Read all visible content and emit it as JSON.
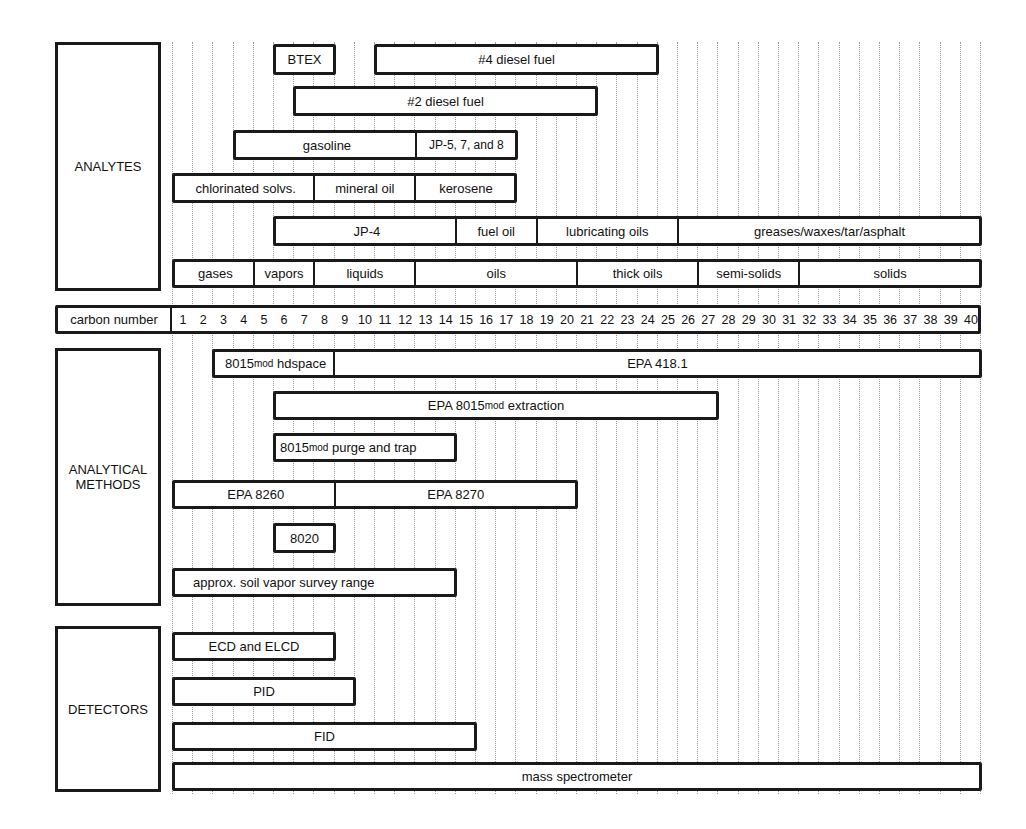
{
  "grid": {
    "x0": 172,
    "col_width": 20.2,
    "columns": 40
  },
  "categories": {
    "analytes": "ANALYTES",
    "methods_line1": "ANALYTICAL",
    "methods_line2": "METHODS",
    "detectors": "DETECTORS"
  },
  "carbon_row": {
    "label": "carbon number",
    "numbers": [
      "1",
      "2",
      "3",
      "4",
      "5",
      "6",
      "7",
      "8",
      "9",
      "10",
      "11",
      "12",
      "13",
      "14",
      "15",
      "16",
      "17",
      "18",
      "19",
      "20",
      "21",
      "22",
      "23",
      "24",
      "25",
      "26",
      "27",
      "28",
      "29",
      "30",
      "31",
      "32",
      "33",
      "34",
      "35",
      "36",
      "37",
      "38",
      "39",
      "40"
    ]
  },
  "analytes": {
    "btex": {
      "label": "BTEX",
      "from": 6,
      "to": 8
    },
    "diesel4": {
      "label": "#4 diesel fuel",
      "from": 11,
      "to": 24
    },
    "diesel2": {
      "label": "#2 diesel fuel",
      "from": 7,
      "to": 21
    },
    "gasoline": {
      "label": "gasoline",
      "from": 4,
      "to": 12
    },
    "jp578": {
      "label": "JP-5, 7, and 8",
      "from": 13,
      "to": 17
    },
    "chlorinated": {
      "label": "chlorinated solvs.",
      "from": 1,
      "to": 7
    },
    "mineral_oil": {
      "label": "mineral oil",
      "from": 8,
      "to": 12
    },
    "kerosene": {
      "label": "kerosene",
      "from": 13,
      "to": 17
    },
    "jp4": {
      "label": "JP-4",
      "from": 6,
      "to": 14
    },
    "fuel_oil": {
      "label": "fuel oil",
      "from": 15,
      "to": 18
    },
    "lubricating_oils": {
      "label": "lubricating oils",
      "from": 19,
      "to": 25
    },
    "greases": {
      "label": "greases/waxes/tar/asphalt",
      "from": 26,
      "to": 40
    },
    "gases": {
      "label": "gases",
      "from": 1,
      "to": 4
    },
    "vapors": {
      "label": "vapors",
      "from": 5,
      "to": 7
    },
    "liquids": {
      "label": "liquids",
      "from": 8,
      "to": 12
    },
    "oils": {
      "label": "oils",
      "from": 13,
      "to": 20
    },
    "thick_oils": {
      "label": "thick oils",
      "from": 21,
      "to": 26
    },
    "semi_solids": {
      "label": "semi-solids",
      "from": 27,
      "to": 31
    },
    "solids": {
      "label": "solids",
      "from": 32,
      "to": 40
    }
  },
  "methods": {
    "hdspace": {
      "prefix": "8015",
      "sub": "mod",
      "suffix": " hdspace",
      "from": 3,
      "to": 8
    },
    "epa4181": {
      "label": "EPA 418.1",
      "from": 9,
      "to": 40
    },
    "extraction": {
      "prefix": "EPA 8015",
      "sub": "mod",
      "suffix": " extraction",
      "from": 6,
      "to": 27
    },
    "purge_trap": {
      "prefix": "8015",
      "sub": "mod",
      "suffix": " purge and trap",
      "from": 6,
      "to": 14
    },
    "epa8260": {
      "label": "EPA 8260",
      "from": 1,
      "to": 8
    },
    "epa8270": {
      "label": "EPA 8270",
      "from": 9,
      "to": 20
    },
    "m8020": {
      "label": "8020",
      "from": 6,
      "to": 8
    },
    "soil_vapor": {
      "label": "approx. soil vapor survey range",
      "from": 1,
      "to": 14
    }
  },
  "detectors": {
    "ecd": {
      "label": "ECD and ELCD",
      "from": 1,
      "to": 8
    },
    "pid": {
      "label": "PID",
      "from": 1,
      "to": 9
    },
    "fid": {
      "label": "FID",
      "from": 1,
      "to": 15
    },
    "ms": {
      "label": "mass spectrometer",
      "from": 1,
      "to": 40
    }
  },
  "chart_data": {
    "type": "gantt-range",
    "title": "",
    "xlabel": "carbon number",
    "x_range": [
      1,
      40
    ],
    "groups": [
      {
        "name": "ANALYTES",
        "ranges": [
          {
            "label": "BTEX",
            "from": 6,
            "to": 8
          },
          {
            "label": "#4 diesel fuel",
            "from": 11,
            "to": 24
          },
          {
            "label": "#2 diesel fuel",
            "from": 7,
            "to": 21
          },
          {
            "label": "gasoline",
            "from": 4,
            "to": 12
          },
          {
            "label": "JP-5, 7, and 8",
            "from": 13,
            "to": 17
          },
          {
            "label": "chlorinated solvs.",
            "from": 1,
            "to": 7
          },
          {
            "label": "mineral oil",
            "from": 8,
            "to": 12
          },
          {
            "label": "kerosene",
            "from": 13,
            "to": 17
          },
          {
            "label": "JP-4",
            "from": 6,
            "to": 14
          },
          {
            "label": "fuel oil",
            "from": 15,
            "to": 18
          },
          {
            "label": "lubricating oils",
            "from": 19,
            "to": 25
          },
          {
            "label": "greases/waxes/tar/asphalt",
            "from": 26,
            "to": 40
          },
          {
            "label": "gases",
            "from": 1,
            "to": 4
          },
          {
            "label": "vapors",
            "from": 5,
            "to": 7
          },
          {
            "label": "liquids",
            "from": 8,
            "to": 12
          },
          {
            "label": "oils",
            "from": 13,
            "to": 20
          },
          {
            "label": "thick oils",
            "from": 21,
            "to": 26
          },
          {
            "label": "semi-solids",
            "from": 27,
            "to": 31
          },
          {
            "label": "solids",
            "from": 32,
            "to": 40
          }
        ]
      },
      {
        "name": "ANALYTICAL METHODS",
        "ranges": [
          {
            "label": "8015mod hdspace",
            "from": 3,
            "to": 8
          },
          {
            "label": "EPA 418.1",
            "from": 9,
            "to": 40
          },
          {
            "label": "EPA 8015mod extraction",
            "from": 6,
            "to": 27
          },
          {
            "label": "8015mod purge and trap",
            "from": 6,
            "to": 14
          },
          {
            "label": "EPA 8260",
            "from": 1,
            "to": 8
          },
          {
            "label": "EPA 8270",
            "from": 9,
            "to": 20
          },
          {
            "label": "8020",
            "from": 6,
            "to": 8
          },
          {
            "label": "approx. soil vapor survey range",
            "from": 1,
            "to": 14
          }
        ]
      },
      {
        "name": "DETECTORS",
        "ranges": [
          {
            "label": "ECD and ELCD",
            "from": 1,
            "to": 8
          },
          {
            "label": "PID",
            "from": 1,
            "to": 9
          },
          {
            "label": "FID",
            "from": 1,
            "to": 15
          },
          {
            "label": "mass spectrometer",
            "from": 1,
            "to": 40
          }
        ]
      }
    ]
  }
}
